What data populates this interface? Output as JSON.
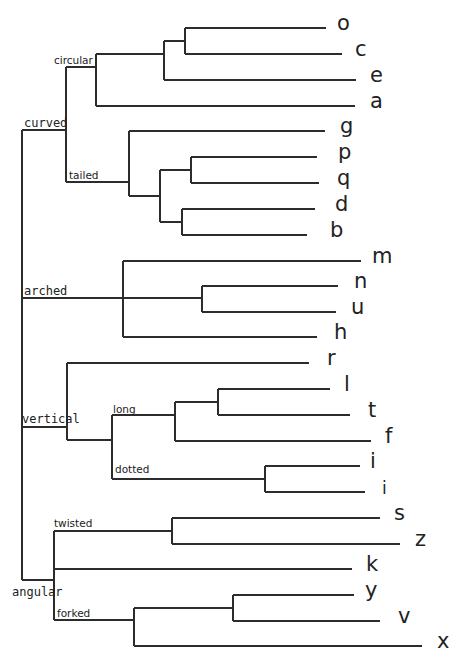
{
  "diagram": {
    "type": "dendrogram",
    "orientation": "left-to-right",
    "categories": {
      "curved": "curved",
      "arched": "arched",
      "vertical": "vertical",
      "angular": "angular"
    },
    "subgroups": {
      "circular": "circular",
      "tailed": "tailed",
      "long": "long",
      "dotted": "dotted",
      "twisted": "twisted",
      "forked": "forked"
    },
    "leaves": [
      {
        "label": "o",
        "y": 28,
        "x_end": 326,
        "label_x": 337
      },
      {
        "label": "c",
        "y": 54,
        "x_end": 342,
        "label_x": 355
      },
      {
        "label": "e",
        "y": 80,
        "x_end": 356,
        "label_x": 370
      },
      {
        "label": "a",
        "y": 106,
        "x_end": 355,
        "label_x": 370
      },
      {
        "label": "g",
        "y": 131,
        "x_end": 325,
        "label_x": 340
      },
      {
        "label": "p",
        "y": 157,
        "x_end": 317,
        "label_x": 338
      },
      {
        "label": "q",
        "y": 183,
        "x_end": 319,
        "label_x": 337
      },
      {
        "label": "d",
        "y": 209,
        "x_end": 315,
        "label_x": 335
      },
      {
        "label": "b",
        "y": 235,
        "x_end": 307,
        "label_x": 330
      },
      {
        "label": "m",
        "y": 261,
        "x_end": 361,
        "label_x": 372
      },
      {
        "label": "n",
        "y": 286,
        "x_end": 338,
        "label_x": 354
      },
      {
        "label": "u",
        "y": 312,
        "x_end": 336,
        "label_x": 351
      },
      {
        "label": "h",
        "y": 337,
        "x_end": 317,
        "label_x": 334
      },
      {
        "label": "r",
        "y": 363,
        "x_end": 309,
        "label_x": 327
      },
      {
        "label": "l",
        "y": 389,
        "x_end": 330,
        "label_x": 344
      },
      {
        "label": "t",
        "y": 415,
        "x_end": 350,
        "label_x": 368
      },
      {
        "label": "f",
        "y": 441,
        "x_end": 371,
        "label_x": 385
      },
      {
        "label": "i",
        "y": 466,
        "x_end": 360,
        "label_x": 370
      },
      {
        "label": "i",
        "y": 492,
        "x_end": 365,
        "label_x": 382
      },
      {
        "label": "s",
        "y": 518,
        "x_end": 380,
        "label_x": 394
      },
      {
        "label": "z",
        "y": 544,
        "x_end": 400,
        "label_x": 415
      },
      {
        "label": "k",
        "y": 569,
        "x_end": 352,
        "label_x": 366
      },
      {
        "label": "y",
        "y": 595,
        "x_end": 354,
        "label_x": 365
      },
      {
        "label": "v",
        "y": 621,
        "x_end": 380,
        "label_x": 398
      },
      {
        "label": "x",
        "y": 646,
        "x_end": 422,
        "label_x": 437
      }
    ]
  }
}
